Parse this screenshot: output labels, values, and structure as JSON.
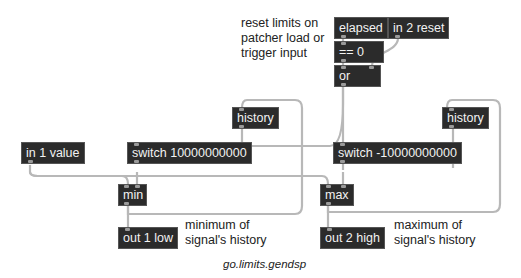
{
  "patcher": {
    "objects": {
      "elapsed": "elapsed",
      "in2": "in 2 reset",
      "eq0": "== 0",
      "or": "or",
      "history_left": "history",
      "history_right": "history",
      "in1": "in 1 value",
      "switch_min": "switch 10000000000",
      "switch_max": "switch -10000000000",
      "min": "min",
      "max": "max",
      "out1": "out 1 low",
      "out2": "out 2 high"
    },
    "comments": {
      "reset": [
        "reset limits on",
        "patcher load or",
        "trigger input"
      ],
      "minimum": [
        "minimum of",
        "signal's history"
      ],
      "maximum": [
        "maximum of",
        "signal's history"
      ]
    },
    "caption": "go.limits.gendsp"
  },
  "colors": {
    "object_bg": "#2b2b2b",
    "object_text": "#f2f2f2",
    "cord": "#b8b8b8"
  }
}
